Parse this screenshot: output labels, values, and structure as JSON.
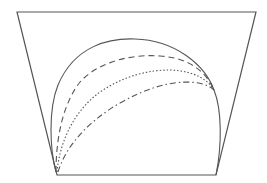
{
  "diagram": {
    "width": 267,
    "height": 183,
    "background": "#ffffff",
    "stroke_color": "#555555",
    "shapes": {
      "trapezoid": {
        "points": [
          [
            17,
            12
          ],
          [
            256,
            12
          ],
          [
            216,
            175
          ],
          [
            57,
            175
          ]
        ],
        "style": "solid",
        "stroke_width": 1.2
      },
      "curves": [
        {
          "name": "solid-arc",
          "style": "solid",
          "dasharray": "",
          "path": "M 56 172 C 50 150, 48 110, 58 85 C 75 45, 110 38, 135 39 C 175 40, 205 65, 214 90 C 222 110, 222 145, 216 175",
          "stroke_width": 1.1
        },
        {
          "name": "dashed-arc",
          "style": "dashed",
          "dasharray": "6 4",
          "path": "M 56 172 C 56 140, 62 105, 80 82 C 100 60, 135 54, 160 56 C 190 58, 206 72, 214 90",
          "stroke_width": 1.1
        },
        {
          "name": "dotted-arc",
          "style": "dotted",
          "dasharray": "1.5 2",
          "path": "M 57 172 C 60 140, 75 110, 100 92 C 125 75, 150 70, 170 70 C 195 71, 208 80, 214 90",
          "stroke_width": 1.1
        },
        {
          "name": "dash-dot-arc",
          "style": "dash-dot",
          "dasharray": "6 3 1.5 3",
          "path": "M 58 172 C 66 145, 90 120, 120 103 C 145 89, 165 83, 185 82 C 202 82, 210 86, 214 90",
          "stroke_width": 1.1
        }
      ]
    }
  }
}
